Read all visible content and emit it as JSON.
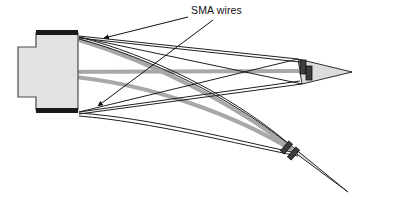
{
  "figure": {
    "domain": "Diagram",
    "width": 394,
    "height": 202,
    "background_color": "#ffffff"
  },
  "annotations": [
    {
      "id": "sma-wires-label",
      "text": "SMA wires",
      "x": 191,
      "y": 14,
      "font_size": 10.5,
      "color": "#111111"
    }
  ],
  "leader_lines": [
    {
      "id": "leader-to-upper-bundle",
      "from": [
        188,
        17
      ],
      "to": [
        104,
        38
      ],
      "arrow_at": "to"
    },
    {
      "id": "leader-to-lower-bundle",
      "from": [
        213,
        20
      ],
      "to": [
        98,
        106
      ],
      "arrow_at": "to"
    }
  ],
  "components": {
    "base_block": {
      "name": "stepped-base-block",
      "fill": "#e2e2e2",
      "stroke": "#4a4a4a",
      "outline_points": "18,47 36,47 36,33 78,33 78,110 36,110 36,97 18,97",
      "clamp_bars": [
        {
          "id": "upper-clamp-bar",
          "x": 36,
          "y": 30,
          "w": 42,
          "h": 5,
          "fill": "#1a1a1a"
        },
        {
          "id": "lower-clamp-bar",
          "x": 36,
          "y": 108,
          "w": 42,
          "h": 5,
          "fill": "#1a1a1a"
        }
      ]
    },
    "upper_tip": {
      "name": "undeformed-beam-tip",
      "fill": "#dcdcdc",
      "stroke": "#2b2b2b",
      "apex": [
        352,
        72
      ],
      "base_top": [
        298,
        59
      ],
      "base_bottom": [
        302,
        84
      ],
      "attachment_blocks": [
        {
          "id": "upper-tip-block-a",
          "x": 300,
          "y": 60,
          "w": 6,
          "h": 14,
          "fill": "#3c3c3c"
        },
        {
          "id": "upper-tip-block-b",
          "x": 306,
          "y": 66,
          "w": 6,
          "h": 14,
          "fill": "#3c3c3c"
        }
      ]
    },
    "lower_tip": {
      "name": "deflected-beam-tip",
      "fill": "#dcdcdc",
      "stroke": "#2b2b2b",
      "apex": [
        348,
        192
      ],
      "base_top": [
        283,
        139
      ],
      "base_bottom": [
        298,
        155
      ],
      "attachment_blocks": [
        {
          "id": "lower-tip-block-a",
          "x": 284,
          "y": 141,
          "w": 5,
          "h": 13,
          "fill": "#3c3c3c",
          "rotate": 40
        },
        {
          "id": "lower-tip-block-b",
          "x": 291,
          "y": 147,
          "w": 5,
          "h": 13,
          "fill": "#3c3c3c",
          "rotate": 40
        }
      ]
    }
  },
  "wires": {
    "thin_stroke_color": "#1f1f1f",
    "thick_stroke_color": "#a8a8a8",
    "thin_width": 1.0,
    "thick_width": 4.0,
    "straight_edges": [
      {
        "id": "upper-beam-edge-top",
        "d": "M 79,36 L 298,59"
      },
      {
        "id": "upper-beam-edge-bottom",
        "d": "M 79,38 L 300,62"
      },
      {
        "id": "upper-beam-lower-edge-a",
        "d": "M 79,112 L 300,81"
      },
      {
        "id": "upper-beam-lower-edge-b",
        "d": "M 79,114 L 302,84"
      }
    ],
    "curved_edges": [
      {
        "id": "deflected-edge-upper-a",
        "d": "M 79,37 C 150,55 230,95 283,139"
      },
      {
        "id": "deflected-edge-upper-b",
        "d": "M 79,39 C 151,58 232,99 286,142"
      },
      {
        "id": "deflected-edge-lower-a",
        "d": "M 79,113 C 150,118 235,140 296,153"
      },
      {
        "id": "deflected-edge-lower-b",
        "d": "M 79,116 C 151,122 237,144 298,156"
      }
    ],
    "sma_strands": [
      {
        "id": "sma-strand-straight-center",
        "d": "M 40,72 L 300,71",
        "thick": true
      },
      {
        "id": "sma-strand-curved-lower",
        "d": "M 62,76 C 150,82 240,118 292,150",
        "thick": true
      },
      {
        "id": "sma-strand-curved-upper",
        "d": "M 79,40 C 152,62 234,104 288,146",
        "thick": true
      }
    ],
    "crossing_lines": [
      {
        "id": "cross-line-a",
        "d": "M 79,37 L 302,84"
      },
      {
        "id": "cross-line-b",
        "d": "M 79,112 L 298,59"
      }
    ]
  },
  "colors": {
    "ink": "#1f1f1f",
    "block_fill": "#e2e2e2",
    "tip_fill": "#dcdcdc",
    "clamp_dark": "#1a1a1a",
    "wire_gray": "#a8a8a8",
    "background": "#ffffff"
  }
}
